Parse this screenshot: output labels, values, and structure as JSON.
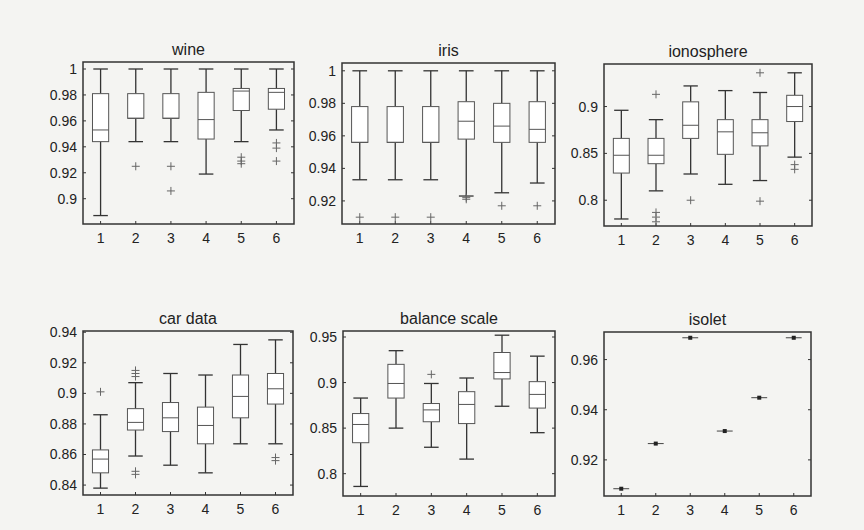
{
  "figure": {
    "background": "#f4f4f2",
    "line_color": "#333333",
    "box_color": "#555555"
  },
  "chart_data": [
    {
      "type": "box",
      "title": "wine",
      "frame": {
        "x0": 83,
        "y0": 62,
        "x1": 294,
        "y1": 224
      },
      "ylim": [
        0.8805,
        1.0054
      ],
      "yticks": [
        1,
        0.98,
        0.96,
        0.94,
        0.92,
        0.9
      ],
      "ytick_labels": [
        "1",
        "0.98",
        "0.96",
        "0.94",
        "0.92",
        "0.9"
      ],
      "categories": [
        "1",
        "2",
        "3",
        "4",
        "5",
        "6"
      ],
      "boxes": [
        {
          "whislo": 0.887,
          "q1": 0.944,
          "med": 0.953,
          "q3": 0.981,
          "whishi": 1.0,
          "fliers": []
        },
        {
          "whislo": 0.944,
          "q1": 0.962,
          "med": 0.962,
          "q3": 0.981,
          "whishi": 1.0,
          "fliers": [
            0.925
          ]
        },
        {
          "whislo": 0.944,
          "q1": 0.962,
          "med": 0.962,
          "q3": 0.981,
          "whishi": 1.0,
          "fliers": [
            0.925,
            0.906
          ]
        },
        {
          "whislo": 0.919,
          "q1": 0.946,
          "med": 0.961,
          "q3": 0.982,
          "whishi": 1.0,
          "fliers": []
        },
        {
          "whislo": 0.944,
          "q1": 0.968,
          "med": 0.983,
          "q3": 0.985,
          "whishi": 1.0,
          "fliers": [
            0.932,
            0.929,
            0.927
          ]
        },
        {
          "whislo": 0.953,
          "q1": 0.969,
          "med": 0.982,
          "q3": 0.985,
          "whishi": 1.0,
          "fliers": [
            0.943,
            0.939,
            0.929
          ]
        }
      ]
    },
    {
      "type": "box",
      "title": "iris",
      "frame": {
        "x0": 342,
        "y0": 63,
        "x1": 555,
        "y1": 224
      },
      "ylim": [
        0.9058,
        1.0048
      ],
      "yticks": [
        1,
        0.98,
        0.96,
        0.94,
        0.92
      ],
      "ytick_labels": [
        "1",
        "0.98",
        "0.96",
        "0.94",
        "0.92"
      ],
      "categories": [
        "1",
        "2",
        "3",
        "4",
        "5",
        "6"
      ],
      "boxes": [
        {
          "whislo": 0.933,
          "q1": 0.956,
          "med": 0.956,
          "q3": 0.978,
          "whishi": 1.0,
          "fliers": [
            0.91
          ]
        },
        {
          "whislo": 0.933,
          "q1": 0.956,
          "med": 0.956,
          "q3": 0.978,
          "whishi": 1.0,
          "fliers": [
            0.91
          ]
        },
        {
          "whislo": 0.933,
          "q1": 0.956,
          "med": 0.956,
          "q3": 0.978,
          "whishi": 1.0,
          "fliers": [
            0.91
          ]
        },
        {
          "whislo": 0.923,
          "q1": 0.958,
          "med": 0.969,
          "q3": 0.981,
          "whishi": 1.0,
          "fliers": [
            0.921,
            0.922
          ]
        },
        {
          "whislo": 0.925,
          "q1": 0.956,
          "med": 0.966,
          "q3": 0.98,
          "whishi": 1.0,
          "fliers": [
            0.917
          ]
        },
        {
          "whislo": 0.931,
          "q1": 0.956,
          "med": 0.964,
          "q3": 0.981,
          "whishi": 1.0,
          "fliers": [
            0.917
          ]
        }
      ]
    },
    {
      "type": "box",
      "title": "ionosphere",
      "frame": {
        "x0": 604,
        "y0": 64,
        "x1": 812,
        "y1": 226
      },
      "ylim": [
        0.7725,
        0.9454
      ],
      "yticks": [
        0.9,
        0.85,
        0.8
      ],
      "ytick_labels": [
        "0.9",
        "0.85",
        "0.8"
      ],
      "categories": [
        "1",
        "2",
        "3",
        "4",
        "5",
        "6"
      ],
      "boxes": [
        {
          "whislo": 0.78,
          "q1": 0.829,
          "med": 0.848,
          "q3": 0.866,
          "whishi": 0.896,
          "fliers": []
        },
        {
          "whislo": 0.81,
          "q1": 0.839,
          "med": 0.848,
          "q3": 0.866,
          "whishi": 0.886,
          "fliers": [
            0.913,
            0.787,
            0.782,
            0.777
          ]
        },
        {
          "whislo": 0.828,
          "q1": 0.866,
          "med": 0.88,
          "q3": 0.905,
          "whishi": 0.922,
          "fliers": [
            0.8
          ]
        },
        {
          "whislo": 0.817,
          "q1": 0.849,
          "med": 0.873,
          "q3": 0.886,
          "whishi": 0.917,
          "fliers": []
        },
        {
          "whislo": 0.821,
          "q1": 0.858,
          "med": 0.872,
          "q3": 0.886,
          "whishi": 0.915,
          "fliers": [
            0.936,
            0.799
          ]
        },
        {
          "whislo": 0.846,
          "q1": 0.884,
          "med": 0.9,
          "q3": 0.912,
          "whishi": 0.936,
          "fliers": [
            0.838,
            0.833
          ]
        }
      ]
    },
    {
      "type": "box",
      "title": "car data",
      "frame": {
        "x0": 83,
        "y0": 331,
        "x1": 293,
        "y1": 495
      },
      "ylim": [
        0.8335,
        0.9408
      ],
      "yticks": [
        0.94,
        0.92,
        0.9,
        0.88,
        0.86,
        0.84
      ],
      "ytick_labels": [
        "0.94",
        "0.92",
        "0.9",
        "0.88",
        "0.86",
        "0.84"
      ],
      "categories": [
        "1",
        "2",
        "3",
        "4",
        "5",
        "6"
      ],
      "boxes": [
        {
          "whislo": 0.838,
          "q1": 0.848,
          "med": 0.857,
          "q3": 0.863,
          "whishi": 0.886,
          "fliers": [
            0.901
          ]
        },
        {
          "whislo": 0.859,
          "q1": 0.876,
          "med": 0.881,
          "q3": 0.89,
          "whishi": 0.907,
          "fliers": [
            0.915,
            0.913,
            0.911,
            0.849,
            0.847
          ]
        },
        {
          "whislo": 0.853,
          "q1": 0.875,
          "med": 0.884,
          "q3": 0.894,
          "whishi": 0.913,
          "fliers": []
        },
        {
          "whislo": 0.848,
          "q1": 0.867,
          "med": 0.879,
          "q3": 0.891,
          "whishi": 0.912,
          "fliers": []
        },
        {
          "whislo": 0.867,
          "q1": 0.884,
          "med": 0.898,
          "q3": 0.912,
          "whishi": 0.932,
          "fliers": []
        },
        {
          "whislo": 0.867,
          "q1": 0.893,
          "med": 0.903,
          "q3": 0.913,
          "whishi": 0.935,
          "fliers": [
            0.858,
            0.856
          ]
        }
      ]
    },
    {
      "type": "box",
      "title": "balance scale",
      "frame": {
        "x0": 343,
        "y0": 331,
        "x1": 555,
        "y1": 496
      },
      "ylim": [
        0.7755,
        0.9566
      ],
      "yticks": [
        0.95,
        0.9,
        0.85,
        0.8
      ],
      "ytick_labels": [
        "0.95",
        "0.9",
        "0.85",
        "0.8"
      ],
      "categories": [
        "1",
        "2",
        "3",
        "4",
        "5",
        "6"
      ],
      "boxes": [
        {
          "whislo": 0.786,
          "q1": 0.834,
          "med": 0.854,
          "q3": 0.866,
          "whishi": 0.883,
          "fliers": []
        },
        {
          "whislo": 0.85,
          "q1": 0.883,
          "med": 0.899,
          "q3": 0.92,
          "whishi": 0.935,
          "fliers": []
        },
        {
          "whislo": 0.829,
          "q1": 0.857,
          "med": 0.87,
          "q3": 0.877,
          "whishi": 0.899,
          "fliers": [
            0.909
          ]
        },
        {
          "whislo": 0.816,
          "q1": 0.855,
          "med": 0.876,
          "q3": 0.89,
          "whishi": 0.905,
          "fliers": []
        },
        {
          "whislo": 0.874,
          "q1": 0.904,
          "med": 0.911,
          "q3": 0.933,
          "whishi": 0.952,
          "fliers": []
        },
        {
          "whislo": 0.845,
          "q1": 0.872,
          "med": 0.887,
          "q3": 0.901,
          "whishi": 0.929,
          "fliers": []
        }
      ]
    },
    {
      "type": "point",
      "title": "isolet",
      "frame": {
        "x0": 604,
        "y0": 332,
        "x1": 811,
        "y1": 496
      },
      "ylim": [
        0.9056,
        0.971
      ],
      "yticks": [
        0.96,
        0.94,
        0.92
      ],
      "ytick_labels": [
        "0.96",
        "0.94",
        "0.92"
      ],
      "categories": [
        "1",
        "2",
        "3",
        "4",
        "5",
        "6"
      ],
      "values": [
        0.9085,
        0.9265,
        0.9687,
        0.9315,
        0.9448,
        0.9687
      ]
    }
  ]
}
